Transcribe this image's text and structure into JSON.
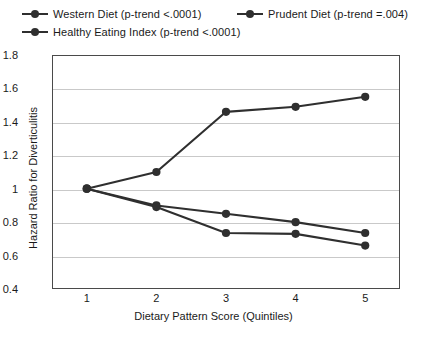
{
  "chart_data": {
    "type": "line",
    "title": "",
    "xlabel": "Dietary Pattern Score (Quintiles)",
    "ylabel": "Hazard Ratio for Diverticulitis",
    "categories": [
      "1",
      "2",
      "3",
      "4",
      "5"
    ],
    "x": [
      1,
      2,
      3,
      4,
      5
    ],
    "xlim": [
      0.5,
      5.5
    ],
    "ylim": [
      0.4,
      1.8
    ],
    "yticks": [
      "0.4",
      "0.6",
      "0.8",
      "1",
      "1.2",
      "1.4",
      "1.6",
      "1.8"
    ],
    "ytick_values": [
      0.4,
      0.6,
      0.8,
      1.0,
      1.2,
      1.4,
      1.6,
      1.8
    ],
    "grid": "horizontal",
    "legend_position": "above-plot",
    "series": [
      {
        "name": "Western Diet (p-trend <.0001)",
        "short_name": "Western Diet",
        "p_trend": "p-trend <.0001",
        "color": "#2f2f2f",
        "values": [
          1.0,
          1.1,
          1.46,
          1.49,
          1.55
        ]
      },
      {
        "name": "Prudent Diet (p-trend =.004)",
        "short_name": "Prudent Diet",
        "p_trend": "p-trend =.004",
        "color": "#2f2f2f",
        "values": [
          1.0,
          0.9,
          0.85,
          0.8,
          0.735
        ]
      },
      {
        "name": "Healthy Eating Index (p-trend <.0001)",
        "short_name": "Healthy Eating Index",
        "p_trend": "p-trend <.0001",
        "color": "#2f2f2f",
        "values": [
          1.0,
          0.89,
          0.735,
          0.73,
          0.66
        ]
      }
    ]
  },
  "legend": {
    "items": [
      {
        "label": "Western Diet (p-trend <.0001)"
      },
      {
        "label": "Prudent Diet (p-trend =.004)"
      },
      {
        "label": "Healthy Eating Index (p-trend <.0001)"
      }
    ]
  },
  "axes": {
    "y_title": "Hazard Ratio for Diverticulitis",
    "x_title": "Dietary Pattern Score (Quintiles)"
  }
}
